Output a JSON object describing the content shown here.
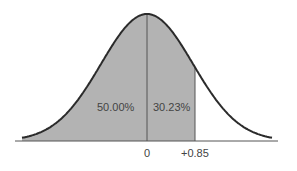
{
  "chart_data": {
    "type": "area",
    "title": "",
    "xlabel": "",
    "ylabel": "",
    "grid": false,
    "legend": null,
    "x_ticks": [
      "0",
      "+0.85"
    ],
    "tick_values": [
      0,
      0.85
    ],
    "regions": [
      {
        "name": "left-half",
        "from": "-inf",
        "to": 0,
        "label": "50.00%",
        "value": 50.0,
        "shaded": true
      },
      {
        "name": "zero-to-z",
        "from": 0,
        "to": 0.85,
        "label": "30.23%",
        "value": 30.23,
        "shaded": true
      },
      {
        "name": "right-tail",
        "from": 0.85,
        "to": "inf",
        "label": "",
        "shaded": false
      }
    ],
    "colors": {
      "shade": "#b3b3b3",
      "curve": "#2b2b2b",
      "line": "#555555",
      "axis": "#555555",
      "text": "#444444"
    }
  },
  "labels": {
    "left_area": "50.00%",
    "mid_area": "30.23%",
    "tick_zero": "0",
    "tick_z": "+0.85"
  }
}
